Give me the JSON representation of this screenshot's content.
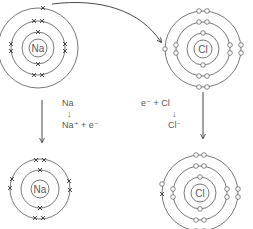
{
  "atoms": {
    "na_atom": {
      "symbol": "Na",
      "shells": 3,
      "electrons": [
        2,
        8,
        1
      ]
    },
    "cl_atom": {
      "symbol": "Cl",
      "shells": 3,
      "electrons": [
        2,
        8,
        7
      ]
    },
    "na_ion": {
      "symbol": "Na",
      "shells": 2,
      "electrons": [
        2,
        8
      ]
    },
    "cl_ion": {
      "symbol": "Cl",
      "shells": 3,
      "electrons": [
        2,
        8,
        8
      ]
    }
  },
  "equations": {
    "sodium": {
      "line1": "Na",
      "arrow": "↓",
      "line2": "Na⁺ + e⁻"
    },
    "chlorine": {
      "line1": "e⁻ + Cl",
      "arrow": "↓",
      "line2": "Cl⁻"
    }
  },
  "legend": {
    "sodium_electron_marker": "x",
    "chlorine_electron_marker": "o"
  }
}
